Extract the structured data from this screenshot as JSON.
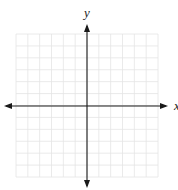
{
  "diagram": {
    "type": "coordinate-plane",
    "axes": {
      "x_label": "x",
      "y_label": "y"
    },
    "grid": {
      "columns": 12,
      "rows": 12,
      "left": 16,
      "right": 158,
      "top": 34,
      "bottom": 177,
      "line_color": "#e4e4e4"
    },
    "axis_color": "#1a1a1a",
    "origin": {
      "x": 87,
      "y": 106
    }
  }
}
